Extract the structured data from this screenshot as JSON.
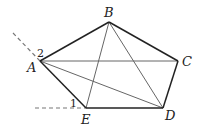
{
  "diagram": {
    "points": {
      "A": {
        "label": "A",
        "x": 40,
        "y": 61,
        "lx": 27,
        "ly": 72
      },
      "B": {
        "label": "B",
        "x": 109,
        "y": 22,
        "lx": 104,
        "ly": 17
      },
      "C": {
        "label": "C",
        "x": 178,
        "y": 61,
        "lx": 182,
        "ly": 66
      },
      "D": {
        "label": "D",
        "x": 163,
        "y": 108,
        "lx": 165,
        "ly": 120
      },
      "E": {
        "label": "E",
        "x": 86,
        "y": 108,
        "lx": 81,
        "ly": 124
      }
    },
    "angle_labels": [
      {
        "label": "2",
        "x": 37,
        "y": 57
      },
      {
        "label": "1",
        "x": 70,
        "y": 107
      }
    ],
    "pentagon_edges": [
      [
        "A",
        "B"
      ],
      [
        "B",
        "C"
      ],
      [
        "C",
        "D"
      ],
      [
        "D",
        "E"
      ],
      [
        "E",
        "A"
      ]
    ],
    "diagonals": [
      [
        "A",
        "C"
      ],
      [
        "A",
        "D"
      ],
      [
        "B",
        "E"
      ],
      [
        "B",
        "D"
      ]
    ],
    "dashed_lines": [
      {
        "x1": 13,
        "y1": 33,
        "x2": 40,
        "y2": 61
      },
      {
        "x1": 35,
        "y1": 108,
        "x2": 86,
        "y2": 108
      }
    ],
    "colors": {
      "edge": "#222222",
      "diagonal": "#666666",
      "dashed": "#777777"
    }
  }
}
